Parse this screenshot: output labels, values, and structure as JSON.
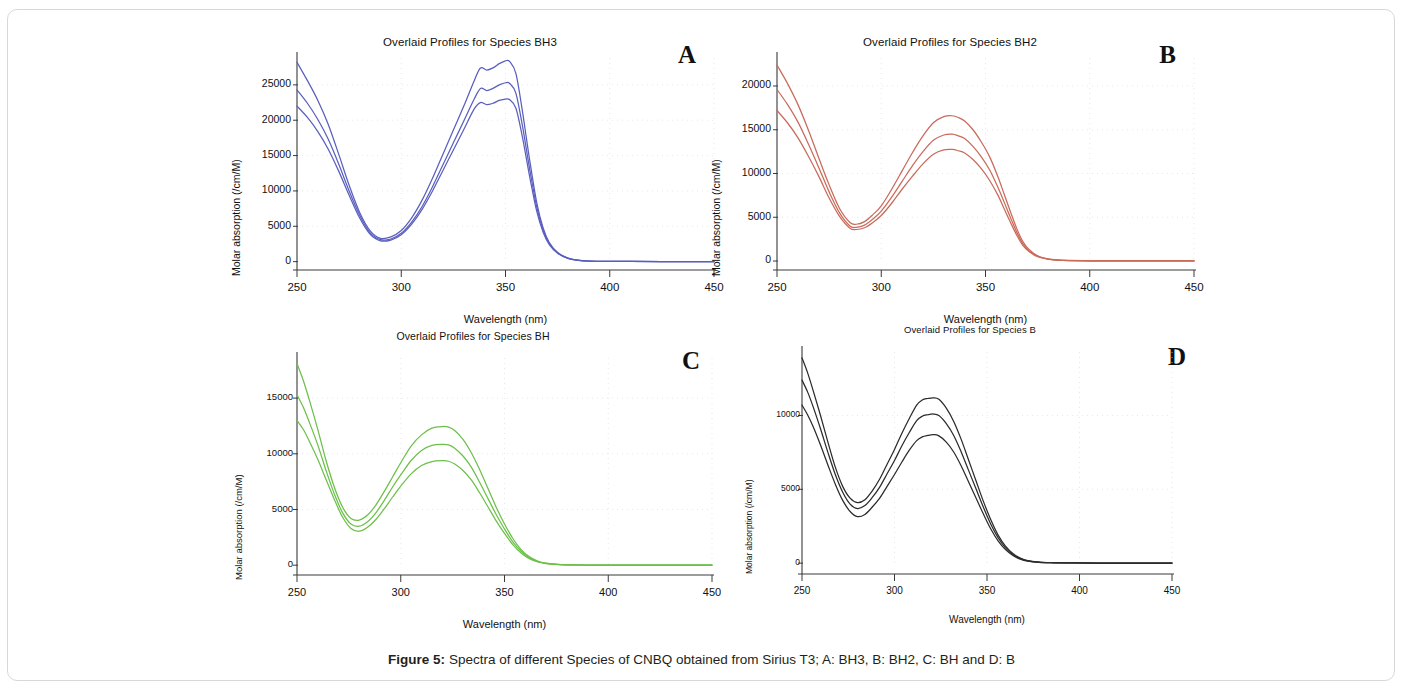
{
  "figure": {
    "caption_prefix": "Figure 5:",
    "caption_text": " Spectra of different Species of CNBQ obtained from Sirius T3; A: BH3, B: BH2, C: BH and D: B"
  },
  "panels": [
    {
      "letter": "A",
      "title": "Overlaid Profiles for Species BH3",
      "xlabel": "Wavelength (nm)",
      "ylabel": "Molar absorption (/cm/M)",
      "color": "#5a5fbe"
    },
    {
      "letter": "B",
      "title": "Overlaid Profiles for Species BH2",
      "xlabel": "Wavelength (nm)",
      "ylabel": "Molar absorption (/cm/M)",
      "color": "#c96a5a"
    },
    {
      "letter": "C",
      "title": "Overlaid Profiles for Species BH",
      "xlabel": "Wavelength (nm)",
      "ylabel": "Molar absorption (/cm/M)",
      "color": "#6cc04a"
    },
    {
      "letter": "D",
      "title": "Overlaid Profiles for Species B",
      "xlabel": "Wavelength (nm)",
      "ylabel": "Molar absorption (/cm/M)",
      "color": "#2b2b2b"
    }
  ],
  "chart_data": [
    {
      "type": "line",
      "panel": "A",
      "title": "Overlaid Profiles for Species BH3",
      "xlabel": "Wavelength (nm)",
      "ylabel": "Molar absorption (/cm/M)",
      "xlim": [
        250,
        450
      ],
      "ylim": [
        -900,
        28800
      ],
      "xticks": [
        250,
        300,
        350,
        400,
        450
      ],
      "yticks": [
        0,
        5000,
        10000,
        15000,
        20000,
        25000
      ],
      "grid": true,
      "color": "#5a5fbe",
      "legend": "none",
      "x": [
        250,
        255,
        260,
        265,
        270,
        275,
        280,
        285,
        290,
        295,
        300,
        305,
        310,
        315,
        320,
        325,
        330,
        335,
        338,
        341,
        344,
        347,
        350,
        352,
        355,
        358,
        360,
        362,
        365,
        368,
        371,
        375,
        380,
        385,
        390,
        400,
        410,
        425,
        450
      ],
      "series": [
        {
          "name": "profile-upper",
          "values": [
            28200,
            25600,
            22800,
            19400,
            15200,
            10800,
            7000,
            4400,
            3300,
            3500,
            4400,
            6200,
            8700,
            11800,
            15200,
            18600,
            22000,
            25600,
            27400,
            27100,
            27400,
            28000,
            28400,
            28300,
            26600,
            21500,
            17500,
            13600,
            8300,
            4800,
            2700,
            1300,
            500,
            200,
            90,
            40,
            25,
            15,
            10
          ]
        },
        {
          "name": "profile-middle",
          "values": [
            24300,
            22400,
            20100,
            17300,
            13800,
            10000,
            6600,
            4100,
            3100,
            3200,
            4000,
            5600,
            7800,
            10600,
            13700,
            16800,
            19900,
            23000,
            24500,
            24200,
            24500,
            25000,
            25300,
            25200,
            23800,
            19400,
            15900,
            12400,
            7700,
            4500,
            2550,
            1250,
            470,
            190,
            85,
            38,
            24,
            14,
            9
          ]
        },
        {
          "name": "profile-lower",
          "values": [
            22000,
            20400,
            18400,
            15900,
            12800,
            9400,
            6200,
            3900,
            2950,
            3050,
            3800,
            5300,
            7400,
            10000,
            12900,
            15800,
            18700,
            21600,
            22500,
            22200,
            22400,
            22800,
            23000,
            22900,
            21700,
            17800,
            14600,
            11400,
            7100,
            4200,
            2400,
            1180,
            450,
            180,
            80,
            36,
            22,
            13,
            8
          ]
        }
      ]
    },
    {
      "type": "line",
      "panel": "B",
      "title": "Overlaid Profiles for Species BH2",
      "xlabel": "Wavelength (nm)",
      "ylabel": "Molar absorption (/cm/M)",
      "xlim": [
        250,
        450
      ],
      "ylim": [
        -800,
        23200
      ],
      "xticks": [
        250,
        300,
        350,
        400,
        450
      ],
      "yticks": [
        0,
        5000,
        10000,
        15000,
        20000
      ],
      "grid": true,
      "color": "#c96a5a",
      "legend": "none",
      "x": [
        250,
        255,
        260,
        265,
        270,
        275,
        280,
        285,
        288,
        292,
        296,
        300,
        305,
        310,
        315,
        320,
        325,
        330,
        334,
        337,
        340,
        344,
        348,
        352,
        356,
        359,
        362,
        365,
        368,
        371,
        375,
        380,
        385,
        390,
        400,
        410,
        425,
        450
      ],
      "series": [
        {
          "name": "profile-upper",
          "values": [
            22400,
            20300,
            17900,
            15000,
            11800,
            8700,
            6000,
            4400,
            4200,
            4500,
            5300,
            6300,
            8200,
            10300,
            12400,
            14300,
            15800,
            16500,
            16600,
            16400,
            16000,
            15000,
            13600,
            11900,
            9600,
            7600,
            5600,
            3700,
            2200,
            1300,
            600,
            240,
            110,
            60,
            25,
            15,
            10,
            5
          ]
        },
        {
          "name": "profile-middle",
          "values": [
            19600,
            17900,
            15900,
            13400,
            10700,
            7900,
            5500,
            4000,
            3850,
            4100,
            4800,
            5700,
            7300,
            9100,
            10900,
            12500,
            13800,
            14400,
            14500,
            14300,
            14000,
            13100,
            11900,
            10400,
            8400,
            6700,
            4950,
            3300,
            1950,
            1150,
            540,
            220,
            100,
            55,
            23,
            14,
            9,
            4
          ]
        },
        {
          "name": "profile-lower",
          "values": [
            17200,
            15800,
            14100,
            12000,
            9700,
            7200,
            5100,
            3750,
            3600,
            3800,
            4400,
            5200,
            6600,
            8200,
            9700,
            11100,
            12200,
            12700,
            12750,
            12600,
            12350,
            11600,
            10550,
            9200,
            7500,
            5950,
            4400,
            2950,
            1750,
            1050,
            490,
            200,
            95,
            50,
            21,
            13,
            8,
            4
          ]
        }
      ]
    },
    {
      "type": "line",
      "panel": "C",
      "title": "Overlaid Profiles for Species BH",
      "xlabel": "Wavelength (nm)",
      "ylabel": "Molar absorption (/cm/M)",
      "xlim": [
        250,
        450
      ],
      "ylim": [
        -700,
        18600
      ],
      "xticks": [
        250,
        300,
        350,
        400,
        450
      ],
      "yticks": [
        0,
        5000,
        10000,
        15000
      ],
      "grid": true,
      "color": "#6cc04a",
      "legend": "none",
      "x": [
        250,
        253,
        256,
        260,
        264,
        268,
        272,
        276,
        280,
        284,
        288,
        292,
        296,
        300,
        305,
        310,
        315,
        320,
        323,
        326,
        330,
        334,
        338,
        342,
        346,
        350,
        354,
        358,
        362,
        366,
        370,
        375,
        380,
        390,
        400,
        420,
        450
      ],
      "series": [
        {
          "name": "profile-upper",
          "values": [
            18100,
            16600,
            14800,
            12200,
            9400,
            7000,
            5200,
            4200,
            4050,
            4500,
            5400,
            6600,
            7900,
            9200,
            10700,
            11700,
            12300,
            12450,
            12400,
            12100,
            11300,
            10100,
            8600,
            6900,
            5200,
            3700,
            2400,
            1400,
            750,
            370,
            180,
            80,
            40,
            18,
            12,
            7,
            4
          ]
        },
        {
          "name": "profile-middle",
          "values": [
            15300,
            14200,
            12800,
            10800,
            8500,
            6400,
            4700,
            3700,
            3500,
            3900,
            4700,
            5800,
            7000,
            8100,
            9400,
            10300,
            10750,
            10850,
            10800,
            10500,
            9800,
            8800,
            7450,
            6000,
            4550,
            3250,
            2100,
            1250,
            670,
            330,
            165,
            73,
            36,
            16,
            11,
            6,
            3
          ]
        },
        {
          "name": "profile-lower",
          "values": [
            13000,
            12200,
            11100,
            9500,
            7700,
            5900,
            4300,
            3300,
            3050,
            3400,
            4100,
            5050,
            6100,
            7100,
            8200,
            8950,
            9300,
            9380,
            9330,
            9080,
            8500,
            7650,
            6500,
            5250,
            3980,
            2850,
            1850,
            1100,
            590,
            290,
            145,
            65,
            32,
            14,
            10,
            5,
            3
          ]
        }
      ]
    },
    {
      "type": "line",
      "panel": "D",
      "title": "Overlaid Profiles for Species B",
      "xlabel": "Wavelength (nm)",
      "ylabel": "Molar absorption (/cm/M)",
      "xlim": [
        250,
        450
      ],
      "ylim": [
        -600,
        14300
      ],
      "xticks": [
        250,
        300,
        350,
        400,
        450
      ],
      "yticks": [
        0,
        5000,
        10000
      ],
      "grid": true,
      "color": "#2b2b2b",
      "legend": "none",
      "x": [
        250,
        253,
        256,
        260,
        264,
        268,
        272,
        276,
        280,
        284,
        288,
        292,
        296,
        300,
        304,
        308,
        312,
        315,
        318,
        321,
        324,
        328,
        332,
        336,
        340,
        344,
        348,
        352,
        356,
        360,
        364,
        368,
        372,
        378,
        385,
        395,
        410,
        450
      ],
      "series": [
        {
          "name": "profile-upper",
          "values": [
            13900,
            12900,
            11700,
            10000,
            8200,
            6500,
            5200,
            4400,
            4100,
            4300,
            4900,
            5700,
            6700,
            7700,
            8800,
            9800,
            10700,
            11050,
            11150,
            11200,
            11100,
            10500,
            9600,
            8400,
            7000,
            5600,
            4200,
            2950,
            1900,
            1150,
            650,
            340,
            170,
            70,
            32,
            15,
            8,
            3
          ]
        },
        {
          "name": "profile-middle",
          "values": [
            12400,
            11600,
            10600,
            9100,
            7500,
            6000,
            4800,
            4000,
            3700,
            3900,
            4450,
            5150,
            6050,
            6950,
            7950,
            8850,
            9650,
            9950,
            10050,
            10100,
            10000,
            9450,
            8650,
            7550,
            6300,
            5050,
            3800,
            2650,
            1720,
            1040,
            590,
            305,
            155,
            63,
            29,
            14,
            7,
            3
          ]
        },
        {
          "name": "profile-lower",
          "values": [
            10700,
            10050,
            9250,
            8000,
            6650,
            5350,
            4250,
            3500,
            3150,
            3300,
            3800,
            4400,
            5200,
            6000,
            6850,
            7650,
            8300,
            8550,
            8650,
            8700,
            8620,
            8200,
            7530,
            6600,
            5520,
            4430,
            3340,
            2330,
            1510,
            915,
            520,
            270,
            136,
            56,
            26,
            12,
            6,
            2
          ]
        }
      ]
    }
  ]
}
